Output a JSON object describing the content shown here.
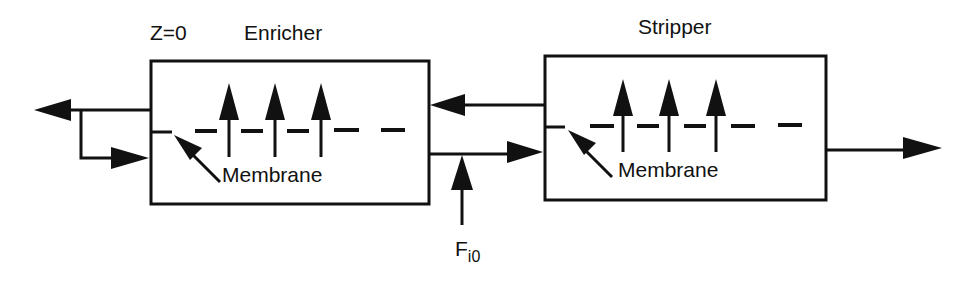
{
  "diagram": {
    "type": "membrane-column-process-flow",
    "stroke_color": "#111111",
    "background": "#ffffff",
    "labels": {
      "z0": "Z=0",
      "enricher": "Enricher",
      "stripper": "Stripper",
      "membrane_enricher": "Membrane",
      "membrane_stripper": "Membrane",
      "feed_main": "F",
      "feed_sub": "i0"
    },
    "units": [
      {
        "name": "Enricher",
        "membrane_arrows": 3
      },
      {
        "name": "Stripper",
        "membrane_arrows": 3
      }
    ],
    "streams": [
      {
        "from": "Enricher",
        "to": "outlet-left",
        "desc": "product out (left)"
      },
      {
        "from": "recycle",
        "to": "Enricher",
        "desc": "reflux back into enricher"
      },
      {
        "from": "Stripper",
        "to": "Enricher",
        "desc": "permeate from stripper to enricher"
      },
      {
        "from": "Enricher",
        "to": "Stripper",
        "desc": "retentate to stripper"
      },
      {
        "from": "feed",
        "to": "Enricher-Stripper line",
        "desc": "feed F_i0"
      },
      {
        "from": "Stripper",
        "to": "outlet-right",
        "desc": "residue out (right)"
      }
    ]
  }
}
